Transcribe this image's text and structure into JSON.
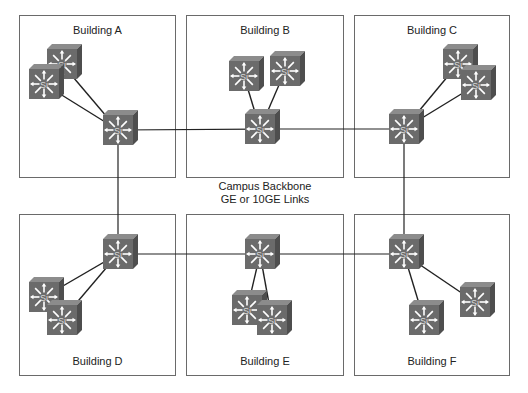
{
  "diagram": {
    "backbone_label_line1": "Campus Backbone",
    "backbone_label_line2": "GE or 10GE Links",
    "colors": {
      "switch_face": "#6b6b6b",
      "switch_top": "#8c8c8c",
      "switch_side": "#4e4e4e",
      "link": "#222222",
      "border": "#6a6a6a"
    },
    "switch_label": "Si",
    "buildings": [
      {
        "id": "A",
        "label": "Building A",
        "x": 19,
        "y": 15,
        "w": 157,
        "h": 163,
        "label_pos": "top"
      },
      {
        "id": "B",
        "label": "Building B",
        "x": 186,
        "y": 15,
        "w": 158,
        "h": 163,
        "label_pos": "top"
      },
      {
        "id": "C",
        "label": "Building C",
        "x": 354,
        "y": 15,
        "w": 156,
        "h": 163,
        "label_pos": "top"
      },
      {
        "id": "D",
        "label": "Building D",
        "x": 19,
        "y": 214,
        "w": 157,
        "h": 162,
        "label_pos": "bottom"
      },
      {
        "id": "E",
        "label": "Building E",
        "x": 186,
        "y": 214,
        "w": 158,
        "h": 162,
        "label_pos": "bottom"
      },
      {
        "id": "F",
        "label": "Building F",
        "x": 354,
        "y": 214,
        "w": 156,
        "h": 162,
        "label_pos": "bottom"
      }
    ],
    "switches": [
      {
        "id": "A-acc1",
        "x": 47,
        "y": 49
      },
      {
        "id": "A-acc2",
        "x": 29,
        "y": 69
      },
      {
        "id": "A-core",
        "x": 103,
        "y": 115
      },
      {
        "id": "B-acc1",
        "x": 229,
        "y": 61
      },
      {
        "id": "B-acc2",
        "x": 270,
        "y": 56
      },
      {
        "id": "B-core",
        "x": 245,
        "y": 114
      },
      {
        "id": "C-acc1",
        "x": 443,
        "y": 49
      },
      {
        "id": "C-acc2",
        "x": 461,
        "y": 70
      },
      {
        "id": "C-core",
        "x": 389,
        "y": 114
      },
      {
        "id": "D-core",
        "x": 103,
        "y": 239
      },
      {
        "id": "D-acc1",
        "x": 29,
        "y": 282
      },
      {
        "id": "D-acc2",
        "x": 47,
        "y": 305
      },
      {
        "id": "E-core",
        "x": 245,
        "y": 239
      },
      {
        "id": "E-acc1",
        "x": 232,
        "y": 295
      },
      {
        "id": "E-acc2",
        "x": 257,
        "y": 305
      },
      {
        "id": "F-core",
        "x": 389,
        "y": 239
      },
      {
        "id": "F-acc1",
        "x": 460,
        "y": 287
      },
      {
        "id": "F-acc2",
        "x": 409,
        "y": 305
      }
    ],
    "links": [
      {
        "from": "A-core",
        "to": "B-core",
        "type": "backbone"
      },
      {
        "from": "B-core",
        "to": "C-core",
        "type": "backbone"
      },
      {
        "from": "D-core",
        "to": "E-core",
        "type": "backbone"
      },
      {
        "from": "E-core",
        "to": "F-core",
        "type": "backbone"
      },
      {
        "from": "A-core",
        "to": "D-core",
        "type": "backbone"
      },
      {
        "from": "C-core",
        "to": "F-core",
        "type": "backbone"
      },
      {
        "from": "A-acc1",
        "to": "A-core",
        "type": "access"
      },
      {
        "from": "A-acc2",
        "to": "A-core",
        "type": "access"
      },
      {
        "from": "B-acc1",
        "to": "B-core",
        "type": "access"
      },
      {
        "from": "B-acc2",
        "to": "B-core",
        "type": "access"
      },
      {
        "from": "C-acc1",
        "to": "C-core",
        "type": "access"
      },
      {
        "from": "C-acc2",
        "to": "C-core",
        "type": "access"
      },
      {
        "from": "D-acc1",
        "to": "D-core",
        "type": "access"
      },
      {
        "from": "D-acc2",
        "to": "D-core",
        "type": "access"
      },
      {
        "from": "E-acc1",
        "to": "E-core",
        "type": "access"
      },
      {
        "from": "E-acc2",
        "to": "E-core",
        "type": "access"
      },
      {
        "from": "F-acc1",
        "to": "F-core",
        "type": "access"
      },
      {
        "from": "F-acc2",
        "to": "F-core",
        "type": "access"
      }
    ]
  }
}
